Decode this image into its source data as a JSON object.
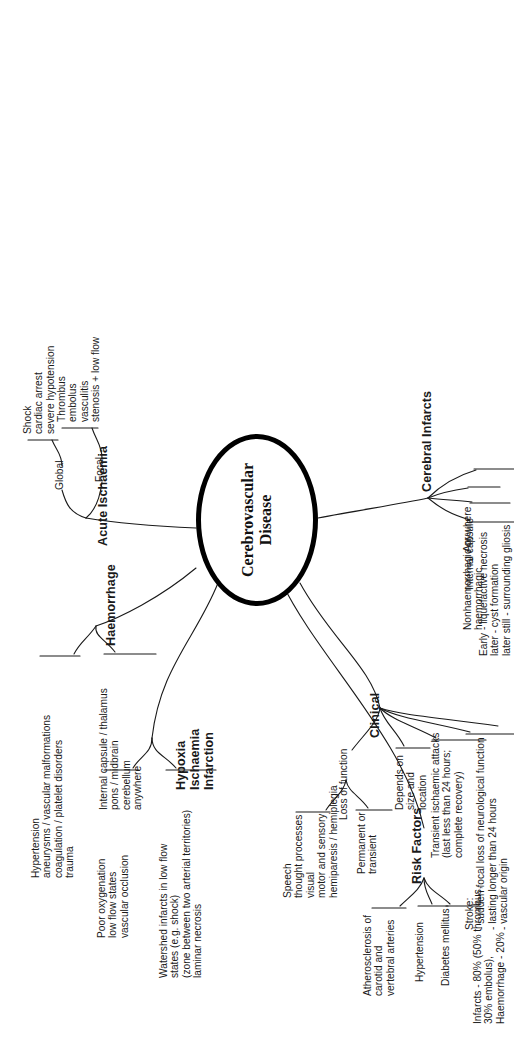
{
  "diagram": {
    "type": "mind-map",
    "title": "Cerebrovascular Disease",
    "center": {
      "label": "Cerebrovascular\nDisease"
    },
    "branches": [
      {
        "id": "hypoxia-ischaemia-infarction",
        "label": "Hypoxia\nIschaemia\nInfarction",
        "children": [
          {
            "id": "hii-causes",
            "label": "Poor oxygenation\nlow flow states\nvascular occlusion"
          },
          {
            "id": "hii-watershed",
            "label": "Watershed infarcts in low flow\nstates (e.g. shock)\n(zone between two arterial territories)\nlaminar necrosis"
          }
        ]
      },
      {
        "id": "haemorrhage",
        "label": "Haemorrhage",
        "children": [
          {
            "id": "haem-causes",
            "label": "Hypertension\naneurysms / vascular malformations\ncoagulation / platelet disorders\ntrauma"
          },
          {
            "id": "haem-sites",
            "label": "Internal capsule / thalamus\npons / midbrain\ncerebellum\nanywhere"
          }
        ]
      },
      {
        "id": "acute-ischaemia",
        "label": "Acute Ischaemia",
        "children": [
          {
            "id": "global",
            "label": "Global",
            "children": [
              {
                "id": "global-causes",
                "label": "Shock\ncardiac arrest\nsevere hypotension"
              }
            ]
          },
          {
            "id": "focal",
            "label": "Focal",
            "children": [
              {
                "id": "focal-causes",
                "label": "Thrombus\nembolus\nvasculitis\nstenosis + low flow"
              }
            ]
          }
        ]
      },
      {
        "id": "cerebral-infarcts",
        "label": "Cerebral Infarcts",
        "children": [
          {
            "id": "ci-type",
            "label": "Nonhaemorrhagic or\nhaemorrhagic"
          },
          {
            "id": "ci-site-internal-capsule",
            "label": "Internal capsule"
          },
          {
            "id": "ci-site-anywhere",
            "label": "Anywhere"
          },
          {
            "id": "ci-evolution",
            "label": "Early - liquefactive necrosis\nlater - cyst formation\nlater still - surrounding gliosis"
          }
        ]
      },
      {
        "id": "clinical",
        "label": "Clinical",
        "children": [
          {
            "id": "loss-of-function",
            "label": "Loss of function",
            "children": [
              {
                "id": "lof-modalities",
                "label": "Speech\nthought processes\nvisual\nmotor and sensory\nhemiparesis / hemiplegia"
              },
              {
                "id": "lof-duration",
                "label": "Permanent or\ntransient"
              }
            ]
          },
          {
            "id": "depends",
            "label": "Depends on\nsize and\nlocation"
          },
          {
            "id": "tia",
            "label": "Transient ischaemic attacks\n(last less than 24 hours;\ncomplete recovery)"
          },
          {
            "id": "stroke",
            "label": "Stroke:\n- sudden focal loss of neurological function\n- lasting longer than 24 hours\n- vascular origin"
          },
          {
            "id": "epidemiology",
            "label": "Infarcts - 80% (50% thrombus,\n30% embolus),\nHaemorrhage - 20%"
          }
        ]
      },
      {
        "id": "risk-factors",
        "label": "Risk Factors",
        "children": [
          {
            "id": "rf-atherosclerosis",
            "label": "Atherosclerosis of\ncarotid and\nvertebral arteries"
          },
          {
            "id": "rf-hypertension",
            "label": "Hypertension"
          },
          {
            "id": "rf-diabetes",
            "label": "Diabetes mellitus"
          }
        ]
      }
    ]
  },
  "style": {
    "line_color": "#1a1a1a",
    "text_color": "#1a1a1a",
    "background": "#ffffff"
  }
}
